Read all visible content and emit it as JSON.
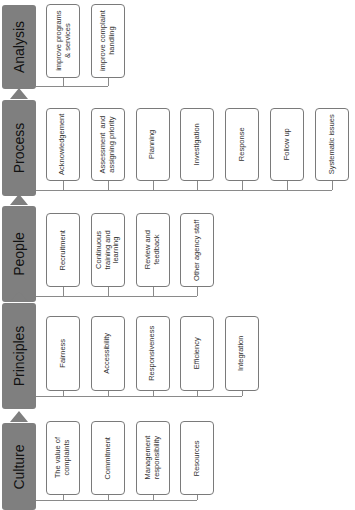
{
  "diagram": {
    "orientation": "rotated-90-ccw",
    "colors": {
      "stage_fill": "#7f7f7f",
      "box_border": "#7a7a7a",
      "connector": "#8a8a8a"
    },
    "stages": [
      {
        "id": "analysis",
        "label": "Analysis",
        "items": [
          "improve programs\n& services",
          "improve complaint\nhandling"
        ]
      },
      {
        "id": "process",
        "label": "Process",
        "items": [
          "Acknowledgement",
          "Assessment  and\nassigning priority",
          "Planning",
          "Investigation",
          "Response",
          "Follow up",
          "Systematic issues"
        ]
      },
      {
        "id": "people",
        "label": "People",
        "items": [
          "Recruitment",
          "Continuous\ntraining and\nlearning",
          "Review and\nfeedback",
          "Other agency staff"
        ]
      },
      {
        "id": "principles",
        "label": "Principles",
        "items": [
          "Fairness",
          "Accessibility",
          "Responsiveness",
          "Efficiency",
          "Integration"
        ]
      },
      {
        "id": "culture",
        "label": "Culture",
        "items": [
          "The value of\ncomplaints",
          "Commitment",
          "Management\nresponsibility",
          "Resources"
        ]
      }
    ],
    "flow": [
      "Culture",
      "Principles",
      "People",
      "Process",
      "Analysis"
    ]
  }
}
